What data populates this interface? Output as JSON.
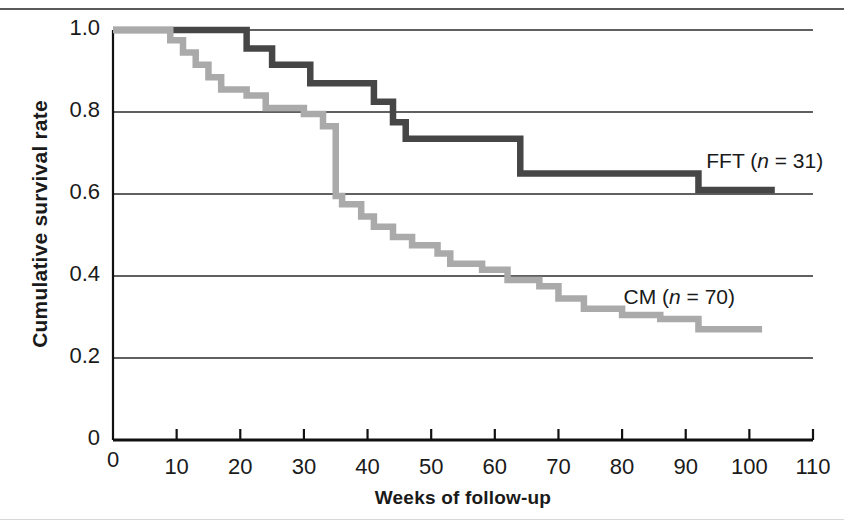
{
  "chart_data": {
    "type": "line",
    "subtype": "kaplan-meier-step",
    "title": "",
    "xlabel": "Weeks of follow-up",
    "ylabel": "Cumulative survival rate",
    "xlim": [
      0,
      110
    ],
    "ylim": [
      0,
      1.0
    ],
    "xticks": [
      0,
      10,
      20,
      30,
      40,
      50,
      60,
      70,
      80,
      90,
      100,
      110
    ],
    "xtick_labels": [
      "0",
      "10",
      "20",
      "30",
      "40",
      "50",
      "60",
      "70",
      "80",
      "90",
      "100",
      "110"
    ],
    "yticks": [
      0,
      0.2,
      0.4,
      0.6,
      0.8,
      1.0
    ],
    "ytick_labels": [
      "0",
      "0.2",
      "0.4",
      "0.6",
      "0.8",
      "1.0"
    ],
    "grid": "horizontal",
    "gridlines_y": [
      0.2,
      0.4,
      0.6,
      0.8,
      1.0
    ],
    "legend_position": "inline-right-of-curve",
    "series": [
      {
        "name": "FFT",
        "label": "FFT (n = 31)",
        "group": "FFT",
        "n": 31,
        "color": "#464646",
        "label_x": 97,
        "label_y": 0.675,
        "steps": [
          [
            0,
            1.0
          ],
          [
            21,
            1.0
          ],
          [
            21,
            0.955
          ],
          [
            25,
            0.955
          ],
          [
            25,
            0.915
          ],
          [
            31,
            0.915
          ],
          [
            31,
            0.87
          ],
          [
            41,
            0.87
          ],
          [
            41,
            0.825
          ],
          [
            44,
            0.825
          ],
          [
            44,
            0.775
          ],
          [
            46,
            0.775
          ],
          [
            46,
            0.735
          ],
          [
            64,
            0.735
          ],
          [
            64,
            0.65
          ],
          [
            92,
            0.65
          ],
          [
            92,
            0.61
          ],
          [
            104,
            0.61
          ]
        ]
      },
      {
        "name": "CM",
        "label": "CM (n = 70)",
        "group": "CM",
        "n": 70,
        "color": "#aaaaaa",
        "label_x": 84,
        "label_y": 0.345,
        "steps": [
          [
            0,
            1.0
          ],
          [
            9,
            1.0
          ],
          [
            9,
            0.975
          ],
          [
            11,
            0.975
          ],
          [
            11,
            0.945
          ],
          [
            13,
            0.945
          ],
          [
            13,
            0.915
          ],
          [
            15,
            0.915
          ],
          [
            15,
            0.885
          ],
          [
            17,
            0.885
          ],
          [
            17,
            0.855
          ],
          [
            21,
            0.855
          ],
          [
            21,
            0.84
          ],
          [
            24,
            0.84
          ],
          [
            24,
            0.81
          ],
          [
            30,
            0.81
          ],
          [
            30,
            0.795
          ],
          [
            33,
            0.795
          ],
          [
            33,
            0.765
          ],
          [
            35,
            0.765
          ],
          [
            35,
            0.735
          ],
          [
            35,
            0.595
          ],
          [
            36,
            0.595
          ],
          [
            36,
            0.575
          ],
          [
            39,
            0.575
          ],
          [
            39,
            0.545
          ],
          [
            41,
            0.545
          ],
          [
            41,
            0.52
          ],
          [
            44,
            0.52
          ],
          [
            44,
            0.495
          ],
          [
            47,
            0.495
          ],
          [
            47,
            0.475
          ],
          [
            51,
            0.475
          ],
          [
            51,
            0.455
          ],
          [
            53,
            0.455
          ],
          [
            53,
            0.43
          ],
          [
            58,
            0.43
          ],
          [
            58,
            0.415
          ],
          [
            62,
            0.415
          ],
          [
            62,
            0.39
          ],
          [
            67,
            0.39
          ],
          [
            67,
            0.375
          ],
          [
            70,
            0.375
          ],
          [
            70,
            0.345
          ],
          [
            74,
            0.345
          ],
          [
            74,
            0.32
          ],
          [
            80,
            0.32
          ],
          [
            80,
            0.305
          ],
          [
            86,
            0.305
          ],
          [
            86,
            0.295
          ],
          [
            92,
            0.295
          ],
          [
            92,
            0.27
          ],
          [
            102,
            0.27
          ]
        ]
      }
    ]
  },
  "axes": {
    "y_title": "Cumulative survival rate",
    "x_title": "Weeks of follow-up"
  }
}
